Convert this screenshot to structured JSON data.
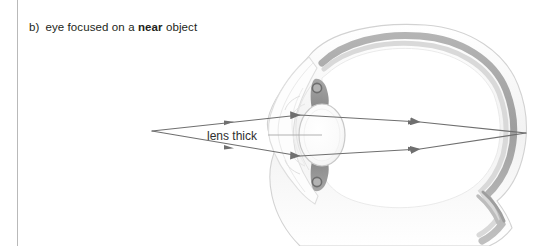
{
  "page": {
    "width": 537,
    "height": 246,
    "background": "#ffffff"
  },
  "rule": {
    "color": "#b9b9b9"
  },
  "caption": {
    "marker": "b)",
    "text_before": "eye focused on a ",
    "emphasis": "near",
    "text_after": " object",
    "full": "b)  eye focused on a near object",
    "color": "#231f20"
  },
  "figure": {
    "label": "lens thick",
    "label_color": "#3a3a3a",
    "ray_color": "#6b6b6b",
    "leader_color": "#9a9a9a",
    "parts": [
      "cornea",
      "anterior-chamber",
      "lens",
      "ciliary-body-upper",
      "ciliary-body-lower",
      "suspensory-ligament-upper",
      "suspensory-ligament-lower",
      "sclera",
      "choroid",
      "retina",
      "vitreous-humour",
      "optic-nerve"
    ],
    "colors": {
      "sclera_outline": "#d6d6d6",
      "sclera_fill": "#fbfbfb",
      "choroid": "#a8a8a8",
      "retina": "#cfcfcf",
      "vitreous": "#ffffff",
      "lens_fill": "#fcfcfc",
      "lens_outline": "#c8c8c8",
      "ciliary_dark": "#8a8a8a",
      "ciliary_dot": "#9b9b9b",
      "cornea_outline": "#dcdcdc"
    },
    "rays": {
      "source_point": [
        152,
        131
      ],
      "focus_point": [
        526,
        133
      ],
      "arrow_positions": [
        [
          230,
          123
        ],
        [
          230,
          147
        ],
        [
          415,
          123
        ],
        [
          415,
          149
        ]
      ],
      "count": 2
    }
  }
}
